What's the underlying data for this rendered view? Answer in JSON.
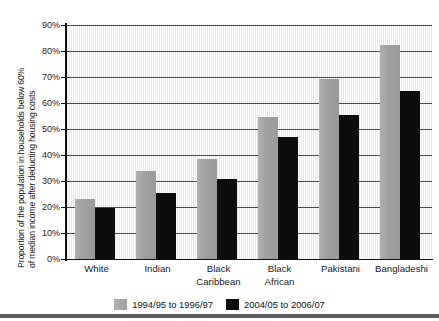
{
  "chart_data": {
    "type": "bar",
    "title": "",
    "xlabel": "",
    "ylabel": "Proportion of the population in households below 60% of median income after deducting housing costs",
    "ylabel_lines": [
      "Proportion of the population in households below 60%",
      "of median income after deducting housing costs"
    ],
    "categories": [
      "White",
      "Indian",
      "Black Caribbean",
      "Black African",
      "Pakistani",
      "Bangladeshi"
    ],
    "category_lines": [
      [
        "White"
      ],
      [
        "Indian"
      ],
      [
        "Black",
        "Caribbean"
      ],
      [
        "Black",
        "African"
      ],
      [
        "Pakistani"
      ],
      [
        "Bangladeshi"
      ]
    ],
    "series": [
      {
        "name": "1994/95 to 1996/97",
        "color": "#a3a3a3",
        "values": [
          23.0,
          34.0,
          38.3,
          54.5,
          69.3,
          82.5
        ]
      },
      {
        "name": "2004/05 to 2006/07",
        "color": "#0d0d0d",
        "values": [
          19.7,
          25.3,
          30.8,
          47.0,
          55.2,
          64.5
        ]
      }
    ],
    "ylim": [
      0,
      90
    ],
    "ytick_values": [
      0,
      10,
      20,
      30,
      40,
      50,
      60,
      70,
      80,
      90
    ],
    "ytick_labels": [
      "0%",
      "10%",
      "20%",
      "30%",
      "40%",
      "50%",
      "60%",
      "70%",
      "80%",
      "90%"
    ],
    "grid": true,
    "grid_axis": "y",
    "legend_position": "bottom-center",
    "units": "percent"
  }
}
